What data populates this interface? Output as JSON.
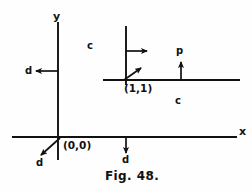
{
  "figure": {
    "caption": "Fig. 48.",
    "axes": {
      "y_label": "y",
      "x_label": "x"
    },
    "points": [
      {
        "name": "origin",
        "label": "(0,0)",
        "x": 0,
        "y": 0
      },
      {
        "name": "point-one-one",
        "label": "(1,1)",
        "x": 1,
        "y": 1
      }
    ],
    "region_labels": [
      {
        "name": "c-upper",
        "text": "c"
      },
      {
        "name": "c-lower",
        "text": "c"
      }
    ],
    "vector_labels": [
      {
        "name": "d-left-of-y-axis",
        "text": "d"
      },
      {
        "name": "d-below-origin",
        "text": "d"
      },
      {
        "name": "d-below-x-axis",
        "text": "d"
      },
      {
        "name": "p-above-x-axis",
        "text": "p"
      }
    ],
    "colors": {
      "ink": "#111111",
      "background": "#fefefe"
    }
  }
}
